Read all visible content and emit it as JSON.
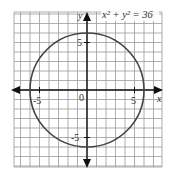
{
  "chart_data": {
    "type": "line",
    "title": "x² + y² = 36",
    "equation": "x² + y² = 36",
    "shape": "circle",
    "center": [
      0,
      0
    ],
    "radius": 6,
    "xlabel": "x",
    "ylabel": "y",
    "xlim": [
      -7.5,
      8
    ],
    "ylim": [
      -8,
      8
    ],
    "x_ticks": [
      -5,
      5
    ],
    "y_ticks": [
      -5,
      5
    ],
    "x_tick_labels": [
      "-5",
      "5"
    ],
    "y_tick_labels": [
      "-5",
      "5"
    ],
    "origin_label": "0",
    "grid": true,
    "grid_step": 1
  },
  "labels": {
    "equation": "x² + y² = 36",
    "x_axis": "x",
    "y_axis": "y",
    "origin": "0",
    "x_neg5": "-5",
    "x_pos5": "5",
    "y_neg5": "-5",
    "y_pos5": "5"
  },
  "colors": {
    "grid": "#9a9a9a",
    "axis": "#111111",
    "curve": "#444444",
    "text": "#333333"
  }
}
